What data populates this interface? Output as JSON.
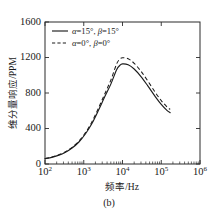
{
  "chart_data": {
    "type": "line",
    "title": "",
    "caption": "(b)",
    "xlabel": "频率/Hz",
    "ylabel": "维分量响应/PPM",
    "xscale": "log",
    "yscale": "linear",
    "xlim": [
      100,
      1000000
    ],
    "ylim": [
      0,
      1600
    ],
    "grid": false,
    "legend_position": "upper-left",
    "xticks": [
      {
        "value": 100,
        "base": "10",
        "exp": "2"
      },
      {
        "value": 1000,
        "base": "10",
        "exp": "3"
      },
      {
        "value": 10000,
        "base": "10",
        "exp": "4"
      },
      {
        "value": 100000,
        "base": "10",
        "exp": "5"
      },
      {
        "value": 1000000,
        "base": "10",
        "exp": "6"
      }
    ],
    "yticks": [
      0,
      400,
      800,
      1200,
      1600
    ],
    "series": [
      {
        "name": "α=15°, β=15°",
        "label_alpha": "α",
        "label_alpha_value": "=15°, ",
        "label_beta": "β",
        "label_beta_value": "=15°",
        "style": "solid",
        "color": "#1c1c1c",
        "x": [
          100,
          150,
          220,
          330,
          500,
          750,
          1100,
          1600,
          2400,
          3500,
          5000,
          7000,
          8500,
          10000,
          14000,
          20000,
          30000,
          45000,
          70000,
          100000,
          140000,
          170000
        ],
        "y": [
          60,
          75,
          97,
          130,
          180,
          248,
          338,
          450,
          605,
          760,
          900,
          1060,
          1110,
          1128,
          1118,
          1070,
          985,
          880,
          760,
          672,
          605,
          578
        ]
      },
      {
        "name": "α=0°, β=0°",
        "label_alpha": "α",
        "label_alpha_value": "=0°, ",
        "label_beta": "β",
        "label_beta_value": "=0°",
        "style": "dashed",
        "color": "#1c1c1c",
        "x": [
          100,
          150,
          220,
          330,
          500,
          750,
          1100,
          1600,
          2400,
          3500,
          5000,
          7000,
          8500,
          10000,
          14000,
          20000,
          30000,
          45000,
          70000,
          100000,
          140000,
          170000
        ],
        "y": [
          62,
          78,
          101,
          136,
          188,
          258,
          352,
          468,
          630,
          792,
          945,
          1125,
          1180,
          1198,
          1185,
          1135,
          1045,
          935,
          808,
          714,
          645,
          615
        ]
      }
    ]
  },
  "axes": {
    "ylabel_text": "维分量响应/PPM",
    "xlabel_text": "频率/Hz",
    "caption": "(b)",
    "ytick_labels": [
      "0",
      "400",
      "800",
      "1200",
      "1600"
    ]
  }
}
